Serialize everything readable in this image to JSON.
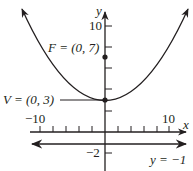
{
  "diagram": {
    "axes": {
      "x_label": "x",
      "y_label": "y",
      "x_tick_labels": {
        "neg": "−10",
        "pos": "10"
      },
      "y_tick_labels": {
        "pos": "10",
        "neg": "−2"
      }
    },
    "focus": {
      "label": "F = (0, 7)",
      "x": 0,
      "y": 7
    },
    "vertex": {
      "label": "V = (0, 3)",
      "x": 0,
      "y": 3
    },
    "directrix": {
      "label": "y = −1",
      "y": -1
    },
    "colors": {
      "ink": "#231f20",
      "background": "#ffffff"
    }
  }
}
